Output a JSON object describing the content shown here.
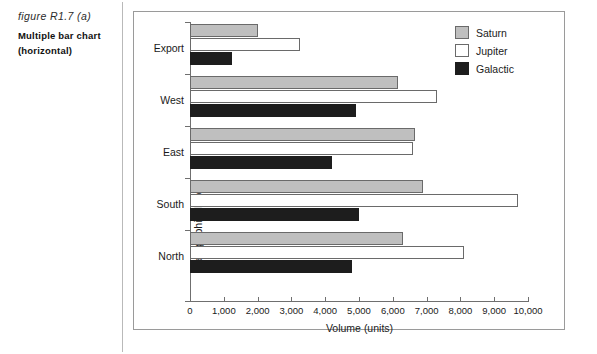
{
  "caption": {
    "figure_id": "figure R1.7 (a)",
    "title_line1": "Multiple bar chart",
    "title_line2": "(horizontal)"
  },
  "legend": {
    "position": "top-right",
    "items": [
      {
        "label": "Saturn",
        "color": "#bfbfbf"
      },
      {
        "label": "Jupiter",
        "color": "#ffffff"
      },
      {
        "label": "Galactic",
        "color": "#1d1d1d"
      }
    ]
  },
  "axes": {
    "x_title": "Volume (units)",
    "y_title": "Geographical Area",
    "x_ticklabels": [
      "0",
      "1,000",
      "2,000",
      "3,000",
      "4,000",
      "5,000",
      "6,000",
      "7,000",
      "8,000",
      "9,000",
      "10,000"
    ]
  },
  "chart_data": {
    "type": "bar",
    "orientation": "horizontal",
    "title": "Multiple bar chart (horizontal)",
    "xlabel": "Volume (units)",
    "ylabel": "Geographical Area",
    "xlim": [
      0,
      10000
    ],
    "xticks": [
      0,
      1000,
      2000,
      3000,
      4000,
      5000,
      6000,
      7000,
      8000,
      9000,
      10000
    ],
    "grid": false,
    "legend_position": "top-right",
    "categories": [
      "Export",
      "West",
      "East",
      "South",
      "North"
    ],
    "series": [
      {
        "name": "Saturn",
        "color": "#bfbfbf",
        "values": [
          2000,
          6150,
          6650,
          6900,
          6300
        ]
      },
      {
        "name": "Jupiter",
        "color": "#ffffff",
        "values": [
          3250,
          7300,
          6600,
          9700,
          8100
        ]
      },
      {
        "name": "Galactic",
        "color": "#1d1d1d",
        "values": [
          1250,
          4900,
          4200,
          5000,
          4800
        ]
      }
    ]
  }
}
